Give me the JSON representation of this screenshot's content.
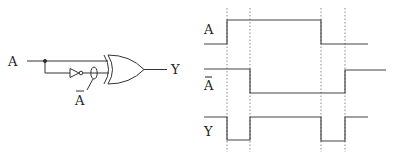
{
  "circuit": {
    "input_label": "A",
    "inverted_label": "A",
    "output_label": "Y",
    "gate_type": "XOR",
    "components": [
      "input-wire-A",
      "junction",
      "inverter",
      "xor-gate",
      "output-wire-Y"
    ]
  },
  "timing": {
    "signals": [
      {
        "label": "A",
        "overbar": false,
        "levels": [
          "low",
          "high",
          "high",
          "low",
          "low"
        ]
      },
      {
        "label": "A",
        "overbar": true,
        "levels": [
          "high",
          "high",
          "low",
          "low",
          "high"
        ]
      },
      {
        "label": "Y",
        "overbar": false,
        "levels": [
          "high",
          "low",
          "high",
          "low",
          "high"
        ]
      }
    ],
    "guide_lines": 4,
    "colors": {
      "line": "#444444",
      "guide": "#888888"
    }
  }
}
